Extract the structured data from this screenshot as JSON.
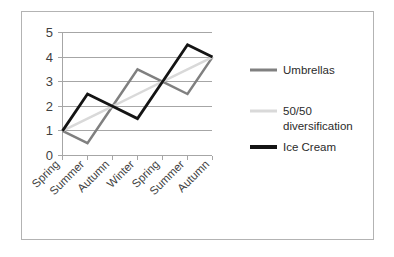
{
  "chart_data": {
    "type": "line",
    "title": "",
    "xlabel": "",
    "ylabel": "",
    "categories": [
      "Spring",
      "Summer",
      "Autumn",
      "Winter",
      "Spring",
      "Summer",
      "Autumn"
    ],
    "ylim": [
      0,
      5
    ],
    "yticks": [
      0,
      1,
      2,
      3,
      4,
      5
    ],
    "ytick_labels": [
      "0",
      "1",
      "2",
      "3",
      "4",
      "5"
    ],
    "grid": true,
    "legend_position": "right",
    "series": [
      {
        "name": "Umbrellas",
        "color": "#808080",
        "width": 2.5,
        "values": [
          1,
          0.5,
          2,
          3.5,
          3,
          2.5,
          4
        ]
      },
      {
        "name": "50/50 diversification",
        "color": "#d9d9d9",
        "width": 2.5,
        "values": [
          1,
          1.5,
          2,
          2.5,
          3,
          3.5,
          4
        ]
      },
      {
        "name": "Ice Cream",
        "color": "#141414",
        "width": 2.8,
        "values": [
          1,
          2.5,
          2,
          1.5,
          3,
          4.5,
          4
        ]
      }
    ]
  },
  "legend": {
    "entries": [
      {
        "label": "Umbrellas",
        "color": "#808080",
        "width": 3
      },
      {
        "label_line1": "50/50",
        "label_line2": "diversification",
        "color": "#d9d9d9",
        "width": 3
      },
      {
        "label": "Ice Cream",
        "color": "#141414",
        "width": 4
      }
    ]
  },
  "yaxis": {
    "t0": "0",
    "t1": "1",
    "t2": "2",
    "t3": "3",
    "t4": "4",
    "t5": "5"
  },
  "xaxis": {
    "c0": "Spring",
    "c1": "Summer",
    "c2": "Autumn",
    "c3": "Winter",
    "c4": "Spring",
    "c5": "Summer",
    "c6": "Autumn"
  }
}
